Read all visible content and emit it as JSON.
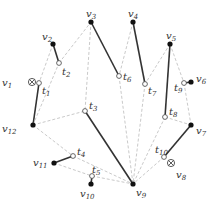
{
  "diagram": {
    "colors": {
      "solid": "#333333",
      "dashed": "#bbbbbb",
      "node": "#111111",
      "hollow_fill": "#ffffff"
    },
    "nodes": [
      {
        "id": "v1",
        "label": "v",
        "sub": "1",
        "x": 32,
        "y": 82,
        "kind": "otimes",
        "lx": 2,
        "ly": 86
      },
      {
        "id": "v2",
        "label": "v",
        "sub": "2",
        "x": 53,
        "y": 44,
        "kind": "filled",
        "lx": 42,
        "ly": 40
      },
      {
        "id": "v3",
        "label": "v",
        "sub": "3",
        "x": 91,
        "y": 22,
        "kind": "filled",
        "lx": 86,
        "ly": 17
      },
      {
        "id": "v4",
        "label": "v",
        "sub": "4",
        "x": 133,
        "y": 22,
        "kind": "filled",
        "lx": 128,
        "ly": 17
      },
      {
        "id": "v5",
        "label": "v",
        "sub": "5",
        "x": 170,
        "y": 44,
        "kind": "filled",
        "lx": 166,
        "ly": 39
      },
      {
        "id": "v6",
        "label": "v",
        "sub": "6",
        "x": 191,
        "y": 82,
        "kind": "filled",
        "lx": 196,
        "ly": 82
      },
      {
        "id": "v7",
        "label": "v",
        "sub": "7",
        "x": 191,
        "y": 125,
        "kind": "filled",
        "lx": 196,
        "ly": 134
      },
      {
        "id": "v8",
        "label": "v",
        "sub": "8",
        "x": 171,
        "y": 163,
        "kind": "otimes",
        "lx": 176,
        "ly": 178
      },
      {
        "id": "v9",
        "label": "v",
        "sub": "9",
        "x": 133,
        "y": 184,
        "kind": "filled",
        "lx": 136,
        "ly": 196
      },
      {
        "id": "v10",
        "label": "v",
        "sub": "10",
        "x": 91,
        "y": 184,
        "kind": "filled",
        "lx": 80,
        "ly": 197
      },
      {
        "id": "v11",
        "label": "v",
        "sub": "11",
        "x": 54,
        "y": 163,
        "kind": "filled",
        "lx": 33,
        "ly": 166
      },
      {
        "id": "v12",
        "label": "v",
        "sub": "12",
        "x": 33,
        "y": 125,
        "kind": "filled",
        "lx": 2,
        "ly": 132
      },
      {
        "id": "t1",
        "label": "t",
        "sub": "1",
        "x": 39,
        "y": 83,
        "kind": "hollow",
        "lx": 42,
        "ly": 94
      },
      {
        "id": "t2",
        "label": "t",
        "sub": "2",
        "x": 59,
        "y": 63,
        "kind": "hollow",
        "lx": 62,
        "ly": 75
      },
      {
        "id": "t3",
        "label": "t",
        "sub": "3",
        "x": 85,
        "y": 111,
        "kind": "hollow",
        "lx": 89,
        "ly": 109
      },
      {
        "id": "t4",
        "label": "t",
        "sub": "4",
        "x": 73,
        "y": 156,
        "kind": "hollow",
        "lx": 77,
        "ly": 155
      },
      {
        "id": "t5",
        "label": "t",
        "sub": "5",
        "x": 92,
        "y": 176,
        "kind": "hollow",
        "lx": 92,
        "ly": 173
      },
      {
        "id": "t6",
        "label": "t",
        "sub": "6",
        "x": 119,
        "y": 76,
        "kind": "hollow",
        "lx": 123,
        "ly": 80
      },
      {
        "id": "t7",
        "label": "t",
        "sub": "7",
        "x": 145,
        "y": 84,
        "kind": "hollow",
        "lx": 148,
        "ly": 94
      },
      {
        "id": "t8",
        "label": "t",
        "sub": "8",
        "x": 165,
        "y": 117,
        "kind": "hollow",
        "lx": 169,
        "ly": 115
      },
      {
        "id": "t9",
        "label": "t",
        "sub": "9",
        "x": 184,
        "y": 83,
        "kind": "hollow",
        "lx": 174,
        "ly": 91
      },
      {
        "id": "t10",
        "label": "t",
        "sub": "10",
        "x": 164,
        "y": 157,
        "kind": "hollow",
        "lx": 155,
        "ly": 153
      }
    ],
    "edges": [
      {
        "from": "v2",
        "to": "t2",
        "style": "solid"
      },
      {
        "from": "t1",
        "to": "v12",
        "style": "solid"
      },
      {
        "from": "v3",
        "to": "t6",
        "style": "solid"
      },
      {
        "from": "v4",
        "to": "t7",
        "style": "solid"
      },
      {
        "from": "v5",
        "to": "t8",
        "style": "solid"
      },
      {
        "from": "t9",
        "to": "v6",
        "style": "solid"
      },
      {
        "from": "v7",
        "to": "t10",
        "style": "solid"
      },
      {
        "from": "t3",
        "to": "v9",
        "style": "solid"
      },
      {
        "from": "t5",
        "to": "v10",
        "style": "solid"
      },
      {
        "from": "v11",
        "to": "t4",
        "style": "solid"
      },
      {
        "from": "v2",
        "to": "t1",
        "style": "dashed"
      },
      {
        "from": "v12",
        "to": "t2",
        "style": "dashed"
      },
      {
        "from": "t2",
        "to": "v3",
        "style": "dashed"
      },
      {
        "from": "v3",
        "to": "t3",
        "style": "dashed"
      },
      {
        "from": "v12",
        "to": "t3",
        "style": "dashed"
      },
      {
        "from": "v12",
        "to": "t4",
        "style": "dashed"
      },
      {
        "from": "t4",
        "to": "v9",
        "style": "dashed"
      },
      {
        "from": "v11",
        "to": "t5",
        "style": "dashed"
      },
      {
        "from": "t5",
        "to": "v9",
        "style": "dashed"
      },
      {
        "from": "v4",
        "to": "t6",
        "style": "dashed"
      },
      {
        "from": "t6",
        "to": "v9",
        "style": "dashed"
      },
      {
        "from": "v5",
        "to": "t7",
        "style": "dashed"
      },
      {
        "from": "t7",
        "to": "v9",
        "style": "dashed"
      },
      {
        "from": "v5",
        "to": "t9",
        "style": "dashed"
      },
      {
        "from": "t9",
        "to": "v7",
        "style": "dashed"
      },
      {
        "from": "t8",
        "to": "v7",
        "style": "dashed"
      },
      {
        "from": "t8",
        "to": "v9",
        "style": "dashed"
      },
      {
        "from": "t10",
        "to": "v9",
        "style": "dashed"
      }
    ]
  }
}
